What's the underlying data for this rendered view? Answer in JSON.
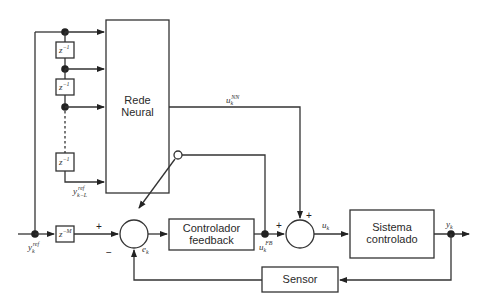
{
  "diagram": {
    "type": "block-diagram",
    "blocks": {
      "neural_net": {
        "label_line1": "Rede",
        "label_line2": "Neural"
      },
      "controller": {
        "label_line1": "Controlador",
        "label_line2": "feedback"
      },
      "plant": {
        "label_line1": "Sistema",
        "label_line2": "controlado"
      },
      "sensor": {
        "label": "Sensor"
      },
      "delays": [
        {
          "base": "z",
          "exp": "−1"
        },
        {
          "base": "z",
          "exp": "−1"
        },
        {
          "base": "z",
          "exp": "−1"
        }
      ],
      "delay_m": {
        "base": "z",
        "exp": "−M"
      }
    },
    "signals": {
      "y_ref": {
        "base": "y",
        "sub": "k",
        "sup": "ref"
      },
      "y_ref_delayed": {
        "base": "y",
        "sub": "k−L",
        "sup": "ref"
      },
      "u_nn": {
        "base": "u",
        "sub": "k",
        "sup": "NN"
      },
      "u_fb": {
        "base": "u",
        "sub": "k",
        "sup": "FB"
      },
      "e": {
        "base": "e",
        "sub": "k"
      },
      "u": {
        "base": "u",
        "sub": "k"
      },
      "y": {
        "base": "y",
        "sub": "k"
      }
    },
    "summing_junctions": {
      "error": {
        "plus": "+",
        "minus": "−"
      },
      "control": {
        "plus_left": "+",
        "plus_top": "+"
      }
    },
    "colors": {
      "line": "#333333",
      "background": "#ffffff"
    }
  }
}
